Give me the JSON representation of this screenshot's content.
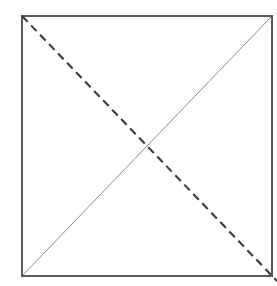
{
  "figure": {
    "title": "Square with two crossing diagonals",
    "background_color": "#ffffff",
    "width": 277,
    "height": 286,
    "caption": ""
  },
  "square": {
    "name": "square-outline",
    "x": 22,
    "y": 16,
    "width": 250,
    "height": 260,
    "stroke_color": "#5a5a5a",
    "stroke_width": 1.2,
    "fill": "none",
    "corners": {
      "top_left": [
        22,
        16
      ],
      "top_right": [
        272,
        16
      ],
      "bottom_right": [
        272,
        276
      ],
      "bottom_left": [
        22,
        276
      ]
    }
  },
  "lines": [
    {
      "name": "solid-diagonal",
      "style": "solid",
      "from": [
        22,
        276
      ],
      "to": [
        272,
        16
      ],
      "stroke_color": "#8c8c8c",
      "stroke_width": 1.0,
      "dash_pattern": "none",
      "description": "thin light grey diagonal from bottom-left corner to top-right corner"
    },
    {
      "name": "dashed-diagonal",
      "style": "dashed",
      "from": [
        22,
        16
      ],
      "to": [
        277,
        281
      ],
      "stroke_color": "#3a3a3a",
      "stroke_width": 2.1,
      "dash_pattern": "8 5",
      "description": "thick dark dashed diagonal from top-left corner extending past the bottom-right corner"
    }
  ],
  "intersection": {
    "name": "diagonal-crossing-point",
    "x": 145,
    "y": 148,
    "label": ""
  }
}
